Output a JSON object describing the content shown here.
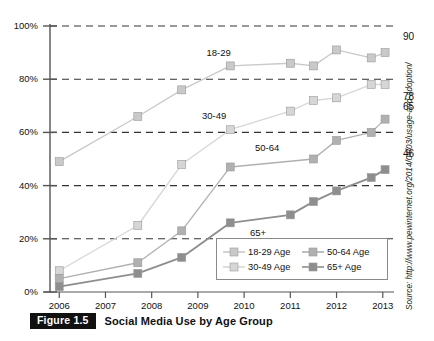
{
  "figure": {
    "badge": "Figure 1.5",
    "title": "Social Media Use by Age Group",
    "source": "Source: http://www.pewinternet.org/2014/04/03/usage-and-adoption/"
  },
  "colors": {
    "series_18_29": "#c9c9c9",
    "series_30_49": "#d6d6d6",
    "series_50_64": "#b0b0b0",
    "series_65_plus": "#8e8e8e",
    "axis": "#555555",
    "grid": "#333333",
    "text": "#111111",
    "badge_bg": "#111111",
    "badge_fg": "#ffffff"
  },
  "chart_data": {
    "type": "line",
    "title": "Social Media Use by Age Group",
    "xlabel": "",
    "ylabel": "",
    "xlim": [
      2005.8,
      2013.2
    ],
    "ylim": [
      0,
      100
    ],
    "grid": true,
    "legend_position": "inside-bottom-right",
    "yticks": [
      "0%",
      "20%",
      "40%",
      "60%",
      "80%",
      "100%"
    ],
    "ytick_values": [
      0,
      20,
      40,
      60,
      80,
      100
    ],
    "xticks": [
      "2006",
      "2007",
      "2008",
      "2009",
      "2010",
      "2011",
      "2012",
      "2013"
    ],
    "xtick_values": [
      2006,
      2007,
      2008,
      2009,
      2010,
      2011,
      2012,
      2013
    ],
    "series": [
      {
        "name": "18-29 Age",
        "tag": "18-29",
        "color": "#c9c9c9",
        "end_label": "90",
        "x": [
          2006.0,
          2007.7,
          2008.65,
          2009.7,
          2011.0,
          2011.5,
          2012.0,
          2012.75,
          2013.05
        ],
        "values": [
          49,
          66,
          76,
          85,
          86,
          85,
          91,
          88,
          90
        ]
      },
      {
        "name": "30-49 Age",
        "tag": "30-49",
        "color": "#d6d6d6",
        "end_label": "78",
        "x": [
          2006.0,
          2007.7,
          2008.65,
          2009.7,
          2011.0,
          2011.5,
          2012.0,
          2012.75,
          2013.05
        ],
        "values": [
          8,
          25,
          48,
          61,
          68,
          72,
          73,
          78,
          78
        ]
      },
      {
        "name": "50-64 Age",
        "tag": "50-64",
        "color": "#b0b0b0",
        "end_label": "65",
        "x": [
          2006.0,
          2007.7,
          2008.65,
          2009.7,
          2011.5,
          2012.0,
          2012.75,
          2013.05
        ],
        "values": [
          5,
          11,
          23,
          47,
          50,
          57,
          60,
          65
        ]
      },
      {
        "name": "65+  Age",
        "tag": "65+",
        "color": "#8e8e8e",
        "end_label": "46",
        "x": [
          2006.0,
          2007.7,
          2008.65,
          2009.7,
          2011.0,
          2011.5,
          2012.0,
          2012.75,
          2013.05
        ],
        "values": [
          2,
          7,
          13,
          26,
          29,
          34,
          38,
          43,
          46
        ]
      }
    ],
    "annotations": [
      {
        "text": "18-29",
        "x": 2009.45,
        "y": 90
      },
      {
        "text": "30-49",
        "x": 2009.35,
        "y": 66
      },
      {
        "text": "50-64",
        "x": 2010.5,
        "y": 54
      },
      {
        "text": "65+",
        "x": 2010.3,
        "y": 22
      }
    ]
  },
  "legend": {
    "entries": [
      {
        "label": "18-29 Age",
        "color": "#c9c9c9"
      },
      {
        "label": "50-64 Age",
        "color": "#b0b0b0"
      },
      {
        "label": "30-49 Age",
        "color": "#d6d6d6"
      },
      {
        "label": "65+  Age",
        "color": "#8e8e8e"
      }
    ]
  }
}
